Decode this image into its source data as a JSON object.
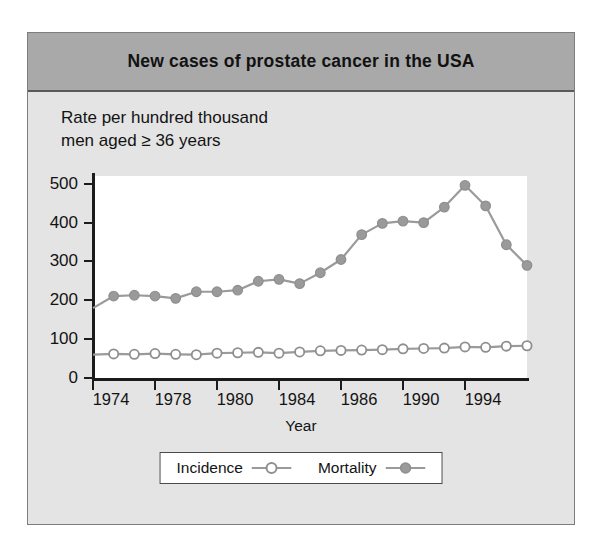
{
  "figure": {
    "title": "New cases of prostate cancer in the USA",
    "subtitle_line1": "Rate per hundred thousand",
    "subtitle_line2": "men aged ≥ 36 years",
    "band_color": "#a9a9a9",
    "body_color": "#e4e4e4",
    "plot_bg": "#ffffff"
  },
  "chart_data": {
    "type": "line",
    "title": "New cases of prostate cancer in the USA",
    "subtitle": "Rate per hundred thousand men aged ≥ 36 years",
    "xlabel": "Year",
    "ylabel": "Rate per hundred thousand men aged ≥ 36 years",
    "xlim": [
      1974,
      1995
    ],
    "ylim": [
      0,
      520
    ],
    "yticks": [
      0,
      100,
      200,
      300,
      400,
      500
    ],
    "ytick_labels": [
      "0",
      "100",
      "200",
      "300",
      "400",
      "500"
    ],
    "xtick_values": [
      1974,
      1977,
      1980,
      1983,
      1986,
      1989,
      1992
    ],
    "xtick_labels": [
      "1974",
      "1978",
      "1980",
      "1984",
      "1986",
      "1990",
      "1994"
    ],
    "grid": false,
    "legend_position": "bottom",
    "x": [
      1974,
      1975,
      1976,
      1977,
      1978,
      1979,
      1980,
      1981,
      1982,
      1983,
      1984,
      1985,
      1986,
      1987,
      1988,
      1989,
      1990,
      1991,
      1992,
      1993,
      1994,
      1995
    ],
    "series": [
      {
        "name": "Incidence",
        "marker": "open-circle",
        "color": "#9a9a9a",
        "values": [
          60,
          62,
          61,
          63,
          61,
          60,
          64,
          65,
          66,
          64,
          67,
          70,
          71,
          72,
          73,
          75,
          76,
          77,
          80,
          79,
          82,
          83
        ]
      },
      {
        "name": "Mortality",
        "marker": "filled-circle",
        "color": "#9a9a9a",
        "values": [
          180,
          211,
          213,
          211,
          205,
          222,
          222,
          226,
          249,
          254,
          243,
          271,
          305,
          369,
          398,
          404,
          400,
          440,
          496,
          443,
          343,
          290
        ]
      }
    ]
  },
  "legend": {
    "items": [
      {
        "label": "Incidence",
        "marker": "open-circle-marker"
      },
      {
        "label": "Mortality",
        "marker": "filled-circle-marker"
      }
    ]
  },
  "axes": {
    "x_title": "Year"
  }
}
